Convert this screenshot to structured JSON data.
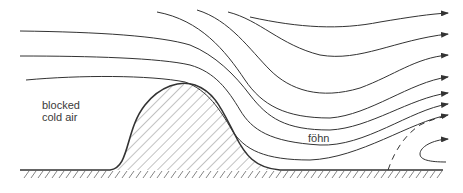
{
  "diagram": {
    "type": "foehn-wind-cross-section",
    "labels": {
      "blocked_line1": "blocked",
      "blocked_line2": "cold air",
      "fohn": "föhn"
    },
    "colors": {
      "background": "#ffffff",
      "stroke": "#333333",
      "hatch": "#666666",
      "text": "#3a3a3a"
    },
    "elements": {
      "mountain": "hatched-ridge",
      "ground": "hatched-ground-line",
      "streamlines_count": 10,
      "dashed_line": "rotor-boundary",
      "rotor": "curved-return-flow-arrow"
    }
  }
}
